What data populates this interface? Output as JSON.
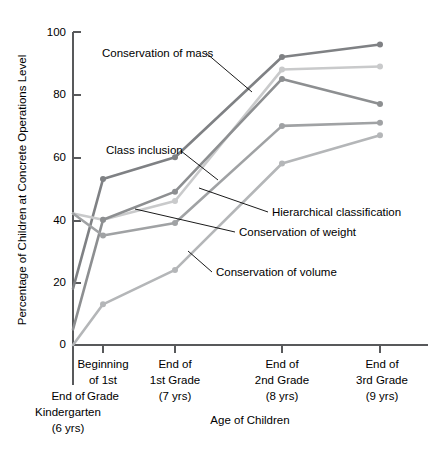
{
  "chart_data": {
    "type": "line",
    "title": "",
    "xlabel": "Age of Children",
    "ylabel": "Percentage of Children at Concrete Operations Level",
    "ylim": [
      0,
      100
    ],
    "yticks": [
      0,
      20,
      40,
      60,
      80,
      100
    ],
    "grid": false,
    "legend_position": "inline-annotations",
    "categories": [
      "End of Kindergarten (6 yrs)",
      "Beginning of 1st Grade",
      "End of 1st Grade (7 yrs)",
      "End of 2nd Grade (8 yrs)",
      "End of 3rd Grade (9 yrs)"
    ],
    "category_lines": [
      [
        "End of",
        "Kindergarten",
        "(6 yrs)"
      ],
      [
        "Beginning",
        "of 1st",
        "Grade"
      ],
      [
        "End of",
        "1st Grade",
        "(7 yrs)"
      ],
      [
        "End of",
        "2nd Grade",
        "(8 yrs)"
      ],
      [
        "End of",
        "3rd Grade",
        "(9 yrs)"
      ]
    ],
    "series": [
      {
        "name": "Conservation of mass",
        "color": "#7f8184",
        "values": [
          18,
          53,
          60,
          92,
          96
        ]
      },
      {
        "name": "Class inclusion",
        "color": "#c9cacb",
        "values": [
          42,
          40,
          46,
          88,
          89
        ]
      },
      {
        "name": "Hierarchical classification",
        "color": "#8d8f91",
        "values": [
          5,
          40,
          49,
          85,
          77
        ]
      },
      {
        "name": "Conservation of weight",
        "color": "#a0a2a4",
        "values": [
          42,
          35,
          39,
          70,
          71
        ]
      },
      {
        "name": "Conservation of volume",
        "color": "#b4b6b8",
        "values": [
          0,
          13,
          24,
          58,
          67
        ]
      }
    ],
    "annotations": [
      {
        "id": "ann-conservation-of-mass",
        "text": "Conservation of mass"
      },
      {
        "id": "ann-class-inclusion",
        "text": "Class inclusion"
      },
      {
        "id": "ann-hierarchical-classification",
        "text": "Hierarchical classification"
      },
      {
        "id": "ann-conservation-of-weight",
        "text": "Conservation of weight"
      },
      {
        "id": "ann-conservation-of-volume",
        "text": "Conservation of volume"
      }
    ],
    "tick_labels": [
      "100",
      "80",
      "60",
      "40",
      "20",
      "0"
    ]
  }
}
